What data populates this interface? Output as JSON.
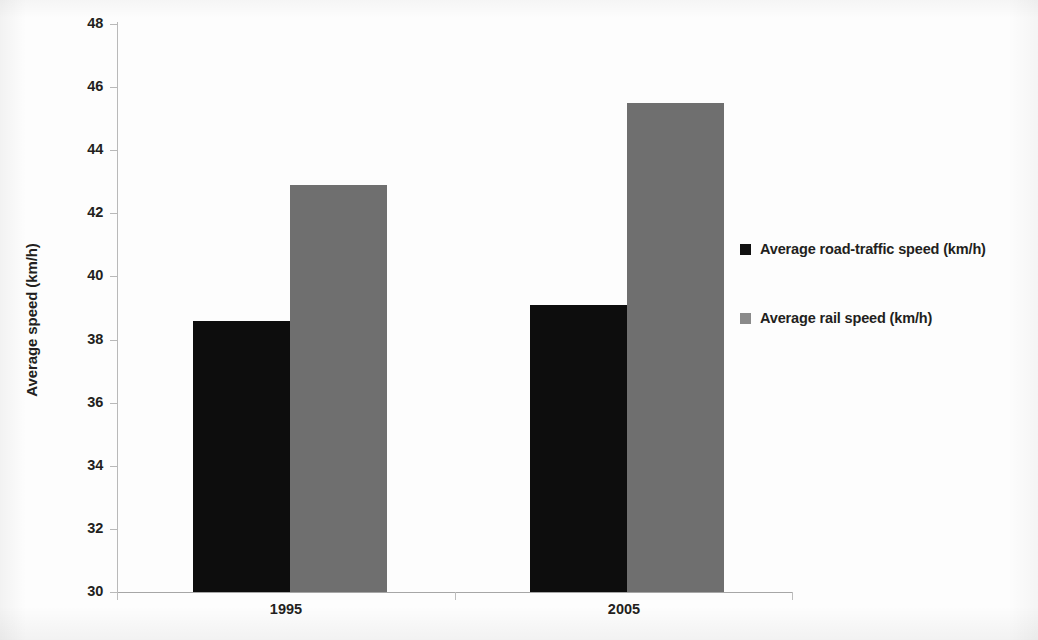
{
  "chart_data": {
    "type": "bar",
    "title": "",
    "subtitle": "",
    "xlabel": "",
    "ylabel": "Average speed (km/h)",
    "categories": [
      "1995",
      "2005"
    ],
    "series": [
      {
        "name": "Average road-traffic speed (km/h)",
        "color": "#0d0d0d",
        "values": [
          38.6,
          39.1
        ]
      },
      {
        "name": "Average rail speed (km/h)",
        "color": "#6f6f6f",
        "values": [
          42.9,
          45.5
        ]
      }
    ],
    "ylim": [
      30,
      48
    ],
    "y_ticks": [
      "30",
      "32",
      "34",
      "36",
      "38",
      "40",
      "42",
      "44",
      "46",
      "48"
    ],
    "y_tick_values": [
      30,
      32,
      34,
      36,
      38,
      40,
      42,
      44,
      46,
      48
    ],
    "grid": false,
    "legend_position": "right"
  },
  "legend": {
    "entries": [
      {
        "label": "Average road-traffic speed (km/h)",
        "swatch": "road"
      },
      {
        "label": "Average rail speed (km/h)",
        "swatch": "rail"
      }
    ]
  },
  "axis": {
    "y_title": "Average speed (km/h)"
  }
}
